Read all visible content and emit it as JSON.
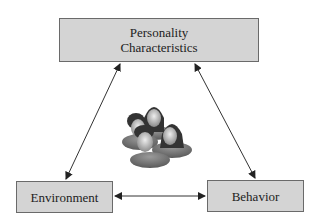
{
  "diagram": {
    "nodes": {
      "personality": {
        "label_line1": "Personality",
        "label_line2": "Characteristics"
      },
      "environment": {
        "label": "Environment"
      },
      "behavior": {
        "label": "Behavior"
      }
    },
    "edges": [
      {
        "from": "personality",
        "to": "environment",
        "type": "bidirectional"
      },
      {
        "from": "personality",
        "to": "behavior",
        "type": "bidirectional"
      },
      {
        "from": "environment",
        "to": "behavior",
        "type": "bidirectional"
      }
    ],
    "center_icon": "group-of-people-icon",
    "colors": {
      "box_fill": "#d4d4d4",
      "box_border": "#6a6a6a",
      "arrow": "#222222"
    }
  }
}
